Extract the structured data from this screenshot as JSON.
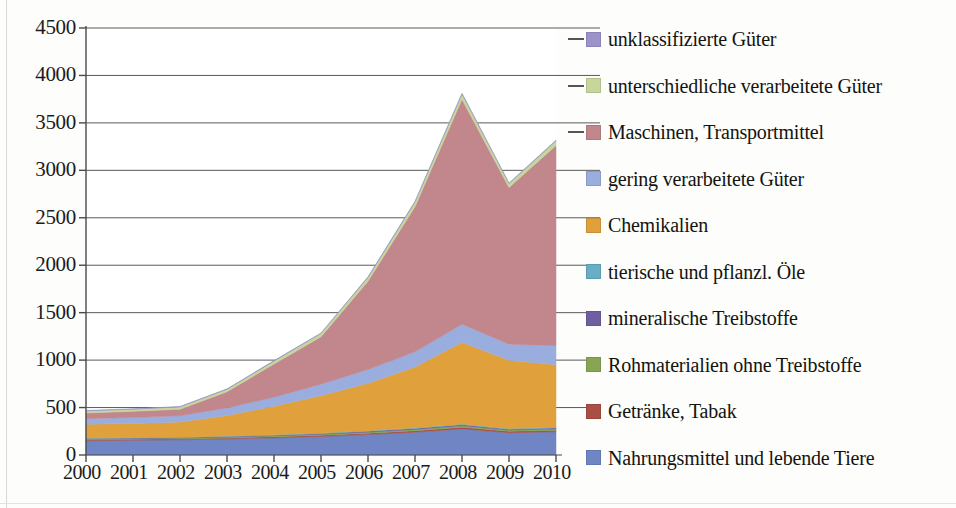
{
  "chart_data": {
    "type": "area",
    "stacked": true,
    "title": "",
    "subtitle": "",
    "xlabel": "",
    "ylabel": "",
    "categories": [
      "2000",
      "2001",
      "2002",
      "2003",
      "2004",
      "2005",
      "2006",
      "2007",
      "2008",
      "2009",
      "2010"
    ],
    "x_tick_labels": [
      "2000",
      "2001",
      "2002",
      "2003",
      "2004",
      "2005",
      "2006",
      "2007",
      "2008",
      "2009",
      "2010"
    ],
    "y_tick_labels": [
      "0",
      "500",
      "1000",
      "1500",
      "2000",
      "2500",
      "3000",
      "3500",
      "4000",
      "4500"
    ],
    "y_ticks": [
      0,
      500,
      1000,
      1500,
      2000,
      2500,
      3000,
      3500,
      4000,
      4500
    ],
    "ylim": [
      0,
      4500
    ],
    "grid": true,
    "grid_axis": "y",
    "legend_position": "right",
    "stack_order_bottom_to_top": [
      "Nahrungsmittel und lebende Tiere",
      "Getränke, Tabak",
      "Rohmaterialien ohne Treibstoffe",
      "mineralische Treibstoffe",
      "tierische und pflanzl. Öle",
      "Chemikalien",
      "gering verarbeitete Güter",
      "Maschinen, Transportmittel",
      "unterschiedliche verarbeitete Güter",
      "unklassifizierte Güter"
    ],
    "series": [
      {
        "name": "Nahrungsmittel und lebende Tiere",
        "color": "#6f85c4",
        "values": [
          150,
          155,
          160,
          170,
          180,
          195,
          215,
          240,
          275,
          235,
          245
        ]
      },
      {
        "name": "Getränke, Tabak",
        "color": "#a94f46",
        "values": [
          10,
          10,
          10,
          10,
          12,
          12,
          14,
          16,
          18,
          15,
          16
        ]
      },
      {
        "name": "Rohmaterialien ohne Treibstoffe",
        "color": "#86a653",
        "values": [
          8,
          8,
          8,
          9,
          10,
          11,
          12,
          14,
          16,
          13,
          14
        ]
      },
      {
        "name": "mineralische Treibstoffe",
        "color": "#6f5fa0",
        "values": [
          6,
          6,
          6,
          7,
          7,
          8,
          9,
          10,
          11,
          9,
          10
        ]
      },
      {
        "name": "tierische und pflanzl. Öle",
        "color": "#68aec4",
        "values": [
          4,
          4,
          4,
          5,
          5,
          5,
          6,
          7,
          8,
          6,
          7
        ]
      },
      {
        "name": "Chemikalien",
        "color": "#e0a03c",
        "values": [
          145,
          150,
          160,
          215,
          300,
          395,
          500,
          640,
          860,
          720,
          660
        ]
      },
      {
        "name": "gering verarbeitete Güter",
        "color": "#99aede",
        "values": [
          60,
          62,
          65,
          80,
          95,
          120,
          145,
          160,
          190,
          170,
          200
        ]
      },
      {
        "name": "Maschinen, Transportmittel",
        "color": "#c2878c",
        "values": [
          60,
          65,
          70,
          170,
          350,
          500,
          930,
          1530,
          2370,
          1650,
          2110
        ]
      },
      {
        "name": "unterschiedliche verarbeitete Güter",
        "color": "#c5d79a",
        "values": [
          22,
          22,
          24,
          26,
          30,
          34,
          40,
          48,
          56,
          42,
          48
        ]
      },
      {
        "name": "unklassifizierte Güter",
        "color": "#9b93c9",
        "values": [
          5,
          5,
          5,
          5,
          6,
          6,
          7,
          8,
          9,
          7,
          8
        ]
      }
    ],
    "totals": [
      470,
      487,
      512,
      697,
      995,
      1286,
      1878,
      2673,
      3813,
      2867,
      3318
    ],
    "annotations": []
  },
  "legend": {
    "items": [
      {
        "label": "unklassifizierte Güter",
        "color": "#9b93c9",
        "has_leader_line": true
      },
      {
        "label": "unterschiedliche verarbeitete Güter",
        "color": "#c5d79a",
        "has_leader_line": true
      },
      {
        "label": "Maschinen, Transportmittel",
        "color": "#c2878c",
        "has_leader_line": true
      },
      {
        "label": "gering verarbeitete Güter",
        "color": "#99aede",
        "has_leader_line": false
      },
      {
        "label": "Chemikalien",
        "color": "#e0a03c",
        "has_leader_line": false
      },
      {
        "label": "tierische und pflanzl. Öle",
        "color": "#68aec4",
        "has_leader_line": false
      },
      {
        "label": "mineralische Treibstoffe",
        "color": "#6f5fa0",
        "has_leader_line": false
      },
      {
        "label": "Rohmaterialien ohne Treibstoffe",
        "color": "#86a653",
        "has_leader_line": false
      },
      {
        "label": "Getränke, Tabak",
        "color": "#a94f46",
        "has_leader_line": false
      },
      {
        "label": "Nahrungsmittel und lebende Tiere",
        "color": "#6f85c4",
        "has_leader_line": false
      }
    ]
  },
  "axis": {
    "y_labels": [
      "4500",
      "4000",
      "3500",
      "3000",
      "2500",
      "2000",
      "1500",
      "1000",
      "500",
      "0"
    ],
    "x_labels": [
      "2000",
      "2001",
      "2002",
      "2003",
      "2004",
      "2005",
      "2006",
      "2007",
      "2008",
      "2009",
      "2010"
    ]
  },
  "style": {
    "grid_color": "#5a5a5a",
    "axis_color": "#4a4a4a",
    "plot_background": "#ffffff",
    "page_background": "#fdfdfb",
    "text_color": "#1b1b1b"
  }
}
